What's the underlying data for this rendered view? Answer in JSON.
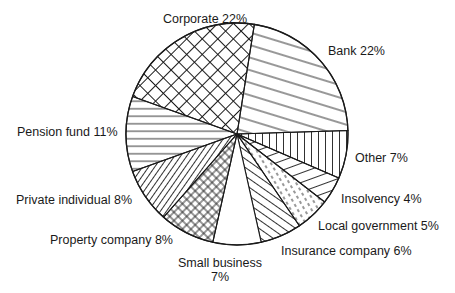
{
  "chart_data": {
    "type": "pie",
    "title": "",
    "start_angle_deg_clockwise_from_top": 9,
    "direction": "clockwise",
    "slices": [
      {
        "label": "Bank",
        "value": 22,
        "display": "Bank 22%",
        "pattern": "diag-shallow"
      },
      {
        "label": "Other",
        "value": 7,
        "display": "Other 7%",
        "pattern": "vertical"
      },
      {
        "label": "Insolvency",
        "value": 4,
        "display": "Insolvency 4%",
        "pattern": "diag-rise"
      },
      {
        "label": "Local government",
        "value": 5,
        "display": "Local government 5%",
        "pattern": "dashes"
      },
      {
        "label": "Insurance company",
        "value": 6,
        "display": "Insurance company 6%",
        "pattern": "diag-back"
      },
      {
        "label": "Small business",
        "value": 7,
        "display": "Small business 7%",
        "pattern": "none"
      },
      {
        "label": "Property company",
        "value": 8,
        "display": "Property company 8%",
        "pattern": "crosshatch-fine"
      },
      {
        "label": "Private individual",
        "value": 8,
        "display": "Private individual 8%",
        "pattern": "diag-fwd"
      },
      {
        "label": "Pension fund",
        "value": 11,
        "display": "Pension fund 11%",
        "pattern": "horizontal"
      },
      {
        "label": "Corporate",
        "value": 22,
        "display": "Corporate 22%",
        "pattern": "crosshatch-large"
      }
    ],
    "legend": "none (direct labels)",
    "units": "%"
  },
  "labels": {
    "bank": "Bank 22%",
    "other": "Other 7%",
    "insolvency": "Insolvency 4%",
    "local_government": "Local government 5%",
    "insurance_company": "Insurance company 6%",
    "small_business_line1": "Small business",
    "small_business_line2": "7%",
    "property_company": "Property company 8%",
    "private_individual": "Private individual 8%",
    "pension_fund": "Pension fund 11%",
    "corporate": "Corporate 22%"
  },
  "colors": {
    "ink": "#1a1a1a",
    "background": "#ffffff"
  }
}
